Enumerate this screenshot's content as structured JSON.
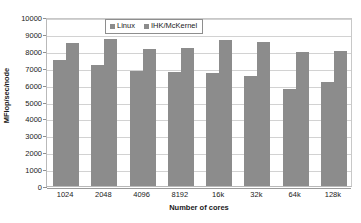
{
  "chart_data": {
    "type": "bar",
    "title": "",
    "subtitle": "",
    "xlabel": "Number of cores",
    "ylabel": "MFlop/sec/node",
    "categories": [
      "1024",
      "2048",
      "4096",
      "8192",
      "16k",
      "32k",
      "64k",
      "128k"
    ],
    "series": [
      {
        "name": "Linux",
        "color": "#8c8c8c",
        "values": [
          7450,
          7180,
          6790,
          6740,
          6680,
          6530,
          5730,
          6150
        ]
      },
      {
        "name": "IHK/McKernel",
        "color": "#8c8c8c",
        "values": [
          8440,
          8700,
          8100,
          8180,
          8660,
          8540,
          7940,
          7990
        ]
      }
    ],
    "ylim": [
      0,
      10000
    ],
    "ytick_step": 1000,
    "yticks": [
      0,
      1000,
      2000,
      3000,
      4000,
      5000,
      6000,
      7000,
      8000,
      9000,
      10000
    ],
    "ytick_labels": [
      "0",
      "1000",
      "2000",
      "3000",
      "4000",
      "5000",
      "6000",
      "7000",
      "8000",
      "9000",
      "10000"
    ],
    "grid": true,
    "grid_axis": "y",
    "legend_position": "top-center",
    "legend_entries": [
      "Linux",
      "IHK/McKernel"
    ],
    "annotations": []
  },
  "colors": {
    "bar_fill": "#8c8c8c",
    "gridline": "#d2d2d2",
    "axis": "#9a9a9a",
    "text": "#1a1a1a",
    "plot_background": "#ffffff",
    "legend_border": "#8e8e8e"
  }
}
